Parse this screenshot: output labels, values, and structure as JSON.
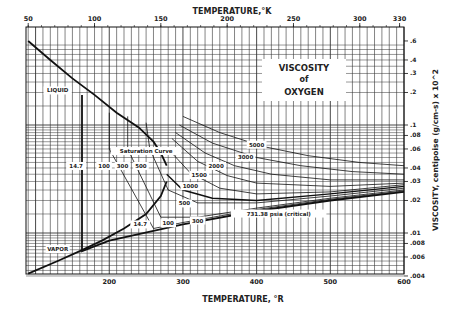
{
  "chart_data": {
    "type": "line",
    "title": "VISCOSITY of OXYGEN",
    "title_lines": [
      "VISCOSITY",
      "of",
      "OXYGEN"
    ],
    "xlabel": "TEMPERATURE, °R",
    "x2label": "TEMPERATURE,°K",
    "ylabel": "VISCOSITY, centipoise (g/cm-s) x 10^2",
    "yscale": "log",
    "xlim": [
      87,
      600
    ],
    "ylim": [
      0.004,
      0.6
    ],
    "x2lim": [
      48,
      333
    ],
    "x_ticks": [
      200,
      300,
      400,
      500,
      600
    ],
    "x2_ticks": [
      50,
      100,
      150,
      200,
      250,
      300,
      330
    ],
    "y_ticks": [
      0.004,
      0.006,
      0.008,
      0.01,
      0.02,
      0.03,
      0.04,
      0.06,
      0.08,
      0.1,
      0.2,
      0.3,
      0.4,
      0.6
    ],
    "y_tick_labels": [
      ".004",
      ".006",
      ".008",
      ".01",
      ".02",
      ".03",
      ".04",
      ".06",
      ".08",
      ".1",
      ".2",
      ".3",
      ".4",
      ".6"
    ],
    "grid": true,
    "series": [
      {
        "name": "Saturation Curve (liquid)",
        "x": [
          90,
          120,
          150,
          180,
          210,
          240,
          260,
          270,
          278
        ],
        "y": [
          0.6,
          0.4,
          0.27,
          0.19,
          0.13,
          0.095,
          0.07,
          0.055,
          0.042
        ]
      },
      {
        "name": "Saturation Curve (vapor)",
        "x": [
          90,
          130,
          160,
          190,
          220,
          250,
          270,
          278
        ],
        "y": [
          0.0042,
          0.0055,
          0.0068,
          0.0085,
          0.011,
          0.015,
          0.022,
          0.03
        ]
      },
      {
        "name": "14.7 psia",
        "x": [
          163,
          163,
          200,
          300,
          400,
          500,
          600
        ],
        "y": [
          0.19,
          0.0068,
          0.0085,
          0.012,
          0.016,
          0.02,
          0.024
        ]
      },
      {
        "name": "100 psia",
        "x": [
          200,
          200,
          260,
          300,
          400,
          500,
          600
        ],
        "y": [
          0.13,
          0.06,
          0.011,
          0.0125,
          0.0165,
          0.0205,
          0.0245
        ]
      },
      {
        "name": "300 psia",
        "x": [
          225,
          225,
          270,
          320,
          400,
          500,
          600
        ],
        "y": [
          0.12,
          0.06,
          0.014,
          0.014,
          0.017,
          0.021,
          0.025
        ]
      },
      {
        "name": "500 psia",
        "x": [
          250,
          255,
          280,
          320,
          400,
          500,
          600
        ],
        "y": [
          0.105,
          0.06,
          0.025,
          0.019,
          0.019,
          0.022,
          0.026
        ]
      },
      {
        "name": "731.38 psia (critical)",
        "x": [
          278,
          300,
          340,
          400,
          500,
          600
        ],
        "y": [
          0.035,
          0.025,
          0.021,
          0.02,
          0.023,
          0.027
        ]
      },
      {
        "name": "1000 psia",
        "x": [
          280,
          310,
          350,
          400,
          500,
          600
        ],
        "y": [
          0.06,
          0.036,
          0.026,
          0.023,
          0.024,
          0.028
        ]
      },
      {
        "name": "1500 psia",
        "x": [
          285,
          320,
          360,
          400,
          500,
          600
        ],
        "y": [
          0.075,
          0.046,
          0.034,
          0.029,
          0.027,
          0.029
        ]
      },
      {
        "name": "2000 psia",
        "x": [
          290,
          330,
          370,
          420,
          500,
          600
        ],
        "y": [
          0.085,
          0.055,
          0.042,
          0.035,
          0.031,
          0.031
        ]
      },
      {
        "name": "3000 psia",
        "x": [
          295,
          340,
          400,
          460,
          530,
          600
        ],
        "y": [
          0.1,
          0.068,
          0.05,
          0.042,
          0.037,
          0.035
        ]
      },
      {
        "name": "5000 psia",
        "x": [
          300,
          350,
          410,
          470,
          540,
          600
        ],
        "y": [
          0.12,
          0.085,
          0.063,
          0.052,
          0.045,
          0.042
        ]
      }
    ],
    "annotations": [
      {
        "text": "LIQUID",
        "x": 130,
        "y": 0.2
      },
      {
        "text": "VAPOR",
        "x": 130,
        "y": 0.0068
      },
      {
        "text": "Saturation Curve",
        "x": 250,
        "y": 0.055
      },
      {
        "text": "14.7",
        "x": 155,
        "y": 0.04
      },
      {
        "text": "100",
        "x": 193,
        "y": 0.04
      },
      {
        "text": "300",
        "x": 218,
        "y": 0.04
      },
      {
        "text": "500",
        "x": 243,
        "y": 0.04
      },
      {
        "text": "500",
        "x": 302,
        "y": 0.018
      },
      {
        "text": "1000",
        "x": 310,
        "y": 0.026
      },
      {
        "text": "1500",
        "x": 322,
        "y": 0.033
      },
      {
        "text": "2000",
        "x": 345,
        "y": 0.04
      },
      {
        "text": "3000",
        "x": 385,
        "y": 0.048
      },
      {
        "text": "5000",
        "x": 400,
        "y": 0.063
      },
      {
        "text": "14.7",
        "x": 242,
        "y": 0.0115
      },
      {
        "text": "100",
        "x": 280,
        "y": 0.0118
      },
      {
        "text": "300",
        "x": 320,
        "y": 0.0125
      },
      {
        "text": "731.38 psia (critical)",
        "x": 430,
        "y": 0.0145
      }
    ]
  }
}
